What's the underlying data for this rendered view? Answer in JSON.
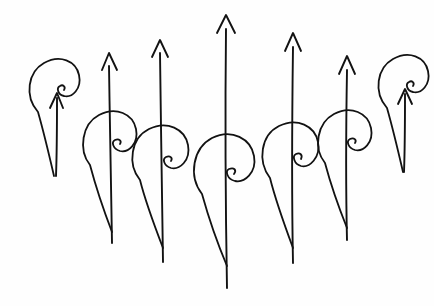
{
  "artwork": {
    "title": "Hand-drawn spiral-and-arrow sequence",
    "description": "Seven hand-inked paisley/spiral flame figures in a row, each pierced by a vertical upward arrow; arrow lengths rise to a peak at the centre figure and fall off symmetrically toward both ends.",
    "medium": "pen-and-ink line drawing",
    "background_color": "#fefefe",
    "ink_color": "#121212",
    "stroke_width_px": 1.8,
    "figure_count": 7,
    "canvas": {
      "width": 434,
      "height": 306
    }
  },
  "figures": [
    {
      "index": 1,
      "name": "spiral-arrow-1",
      "stem_x": 55,
      "arrow_tip_y": 92,
      "arrow_tail_y": 176,
      "arrow_length": 84,
      "spiral_center_x": 50,
      "spiral_center_y": 100,
      "spiral_scale": 1.0,
      "teardrop_bottom_y": 175,
      "eye_x": 56,
      "eye_y": 97,
      "size_rank": "short"
    },
    {
      "index": 2,
      "name": "spiral-arrow-2",
      "stem_x": 110,
      "arrow_tip_y": 52,
      "arrow_tail_y": 243,
      "arrow_length": 191,
      "spiral_center_x": 105,
      "spiral_center_y": 150,
      "spiral_scale": 1.05,
      "teardrop_bottom_y": 232,
      "eye_x": 114,
      "eye_y": 150,
      "size_rank": "medium"
    },
    {
      "index": 3,
      "name": "spiral-arrow-3",
      "stem_x": 161,
      "arrow_tip_y": 39,
      "arrow_tail_y": 262,
      "arrow_length": 223,
      "spiral_center_x": 157,
      "spiral_center_y": 165,
      "spiral_scale": 1.08,
      "teardrop_bottom_y": 248,
      "eye_x": 168,
      "eye_y": 170,
      "size_rank": "tall"
    },
    {
      "index": 4,
      "name": "spiral-arrow-4",
      "stem_x": 226,
      "arrow_tip_y": 15,
      "arrow_tail_y": 288,
      "arrow_length": 273,
      "spiral_center_x": 221,
      "spiral_center_y": 178,
      "spiral_scale": 1.15,
      "teardrop_bottom_y": 266,
      "eye_x": 233,
      "eye_y": 189,
      "size_rank": "tallest"
    },
    {
      "index": 5,
      "name": "spiral-arrow-5",
      "stem_x": 293,
      "arrow_tip_y": 33,
      "arrow_tail_y": 263,
      "arrow_length": 230,
      "spiral_center_x": 288,
      "spiral_center_y": 162,
      "spiral_scale": 1.08,
      "teardrop_bottom_y": 248,
      "eye_x": 302,
      "eye_y": 170,
      "size_rank": "tall"
    },
    {
      "index": 6,
      "name": "spiral-arrow-6",
      "stem_x": 348,
      "arrow_tip_y": 56,
      "arrow_tail_y": 240,
      "arrow_length": 184,
      "spiral_center_x": 343,
      "spiral_center_y": 148,
      "spiral_scale": 1.02,
      "teardrop_bottom_y": 228,
      "eye_x": 354,
      "eye_y": 148,
      "size_rank": "medium"
    },
    {
      "index": 7,
      "name": "spiral-arrow-7",
      "stem_x": 404,
      "arrow_tip_y": 88,
      "arrow_tail_y": 172,
      "arrow_length": 84,
      "spiral_center_x": 399,
      "spiral_center_y": 96,
      "spiral_scale": 1.0,
      "teardrop_bottom_y": 170,
      "eye_x": 406,
      "eye_y": 93,
      "size_rank": "short"
    }
  ],
  "paths": {
    "spiral_1": "M 38 112 C 24 96 28 72 44 63 C 60 54 76 61 79 75 C 82 89 72 98 64 96 C 58 95 56 88 60 86 C 63 84 66 87 64 90 M 38 112 C 42 126 48 150 54 176",
    "arrow_1": "M 56 176 C 57 150 57 122 57 98 M 50 108 L 57 93 L 63 108",
    "spiral_2": "M 90 165 C 78 150 82 124 99 115 C 116 106 133 114 136 129 C 139 144 128 153 120 151 C 113 149 111 142 115 140 C 119 138 122 141 120 144 M 90 165 C 94 180 102 206 112 232",
    "arrow_2": "M 112 243 C 111 200 110 130 109 66 M 102 70 L 109 53 L 117 70",
    "spiral_3": "M 140 180 C 127 164 131 138 149 129 C 167 120 185 129 188 145 C 191 161 179 170 171 168 C 164 166 162 159 166 157 C 170 155 173 158 171 161 M 140 180 C 144 196 153 222 163 248",
    "arrow_3": "M 163 262 C 162 214 161 120 160 53 M 152 57 L 160 40 L 168 57",
    "spiral_4": "M 202 194 C 188 176 193 148 212 138 C 232 128 251 139 254 156 C 257 173 244 183 235 181 C 227 179 225 171 229 169 C 234 167 237 170 234 174 M 202 194 C 207 212 216 240 227 266",
    "arrow_4": "M 227 288 C 226 232 225 120 226 29 M 217 33 L 226 15 L 235 33",
    "spiral_5": "M 270 178 C 257 161 261 135 279 126 C 297 117 315 126 318 142 C 321 158 309 168 301 166 C 294 164 292 156 296 154 C 300 152 303 155 301 159 M 270 178 C 274 194 283 221 293 248",
    "arrow_5": "M 293 263 C 292 212 292 120 293 47 M 285 51 L 293 33 L 301 51",
    "spiral_6": "M 325 163 C 313 148 317 123 334 114 C 351 105 368 113 371 128 C 374 143 363 152 355 150 C 348 148 346 141 350 139 C 354 137 357 140 355 143 M 325 163 C 329 178 337 203 347 228",
    "arrow_6": "M 347 240 C 346 198 346 128 347 70 M 339 74 L 347 56 L 355 74",
    "spiral_7": "M 387 108 C 373 92 377 68 393 59 C 409 50 425 57 428 71 C 431 85 421 94 413 92 C 407 91 405 84 409 82 C 412 80 415 83 413 86 M 387 108 C 391 122 397 146 403 172",
    "arrow_7": "M 404 172 C 405 146 405 118 405 94 M 398 104 L 405 89 L 412 104"
  }
}
